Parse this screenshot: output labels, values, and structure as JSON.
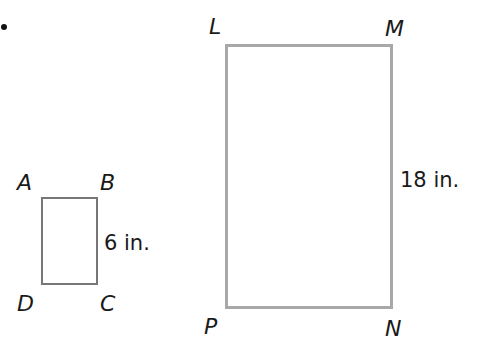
{
  "figure": {
    "bullet": "•",
    "small_rectangle": {
      "vertices": {
        "top_left": "A",
        "top_right": "B",
        "bottom_right": "C",
        "bottom_left": "D"
      },
      "side_label": "6 in."
    },
    "large_rectangle": {
      "vertices": {
        "top_left": "L",
        "top_right": "M",
        "bottom_right": "N",
        "bottom_left": "P"
      },
      "side_label": "18 in."
    },
    "colors": {
      "small_border": "#777777",
      "large_border": "#a8a8a8",
      "text": "#1a1a1a"
    }
  }
}
